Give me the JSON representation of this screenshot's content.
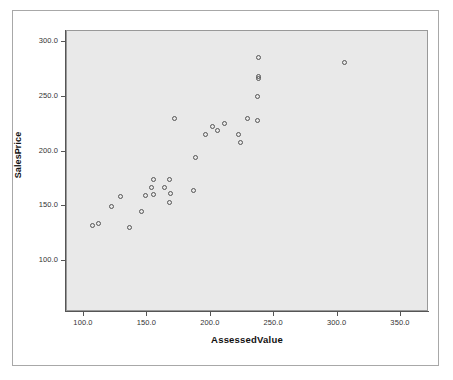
{
  "chart_data": {
    "type": "scatter",
    "title": "",
    "xlabel": "AssessedValue",
    "ylabel": "SalesPrice",
    "xlim": [
      85,
      362
    ],
    "ylim": [
      89,
      311
    ],
    "xticks": [
      "100.0",
      "150.0",
      "200.0",
      "250.0",
      "300.0",
      "350.0"
    ],
    "xtick_values": [
      100,
      150,
      200,
      250,
      300,
      350
    ],
    "yticks": [
      "100.0",
      "150.0",
      "200.0",
      "250.0",
      "300.0"
    ],
    "ytick_values": [
      100,
      150,
      200,
      250,
      300
    ],
    "grid": false,
    "legend": null,
    "marker": "open-circle",
    "points": [
      {
        "x": 107,
        "y": 132
      },
      {
        "x": 112,
        "y": 134
      },
      {
        "x": 136,
        "y": 130
      },
      {
        "x": 122,
        "y": 149
      },
      {
        "x": 129,
        "y": 158
      },
      {
        "x": 146,
        "y": 145
      },
      {
        "x": 149,
        "y": 159
      },
      {
        "x": 154,
        "y": 167
      },
      {
        "x": 155,
        "y": 174
      },
      {
        "x": 155,
        "y": 160
      },
      {
        "x": 164,
        "y": 167
      },
      {
        "x": 168,
        "y": 174
      },
      {
        "x": 169,
        "y": 161
      },
      {
        "x": 168,
        "y": 153
      },
      {
        "x": 172,
        "y": 230
      },
      {
        "x": 187,
        "y": 164
      },
      {
        "x": 188,
        "y": 194
      },
      {
        "x": 196,
        "y": 215
      },
      {
        "x": 202,
        "y": 222
      },
      {
        "x": 206,
        "y": 219
      },
      {
        "x": 211,
        "y": 225
      },
      {
        "x": 222,
        "y": 215
      },
      {
        "x": 224,
        "y": 208
      },
      {
        "x": 229,
        "y": 230
      },
      {
        "x": 237,
        "y": 228
      },
      {
        "x": 237,
        "y": 250
      },
      {
        "x": 238,
        "y": 266
      },
      {
        "x": 238,
        "y": 268
      },
      {
        "x": 238,
        "y": 285
      },
      {
        "x": 306,
        "y": 281
      }
    ]
  },
  "labels": {
    "y_axis_title": "SalesPrice",
    "x_axis_title": "AssessedValue"
  },
  "colors": {
    "plot_background": "#e9e9e9",
    "page_background": "#ffffff",
    "marker_stroke": "#555555",
    "axis": "#555555",
    "frame_border": "#a8a8a8"
  }
}
